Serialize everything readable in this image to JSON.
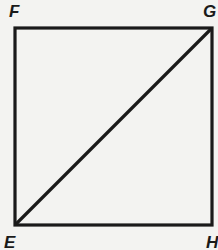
{
  "diagram": {
    "type": "square-with-diagonal",
    "vertices": {
      "top_left": "F",
      "top_right": "G",
      "bottom_left": "E",
      "bottom_right": "H"
    },
    "diagonal": "EG",
    "colors": {
      "background": "#f3f3f1",
      "stroke": "#1a1a1a"
    }
  }
}
